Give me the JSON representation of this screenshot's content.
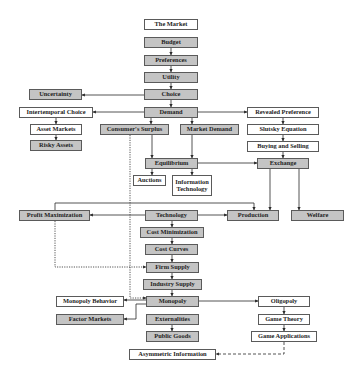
{
  "colors": {
    "shaded_box": "#c4c4c4",
    "plain_box": "#ffffff",
    "border": "#5a5a5a",
    "line": "#2a2a2a",
    "text": "#1e1e1e"
  },
  "legend_note": "Shaded boxes and white boxes distinguish chapter groups",
  "nodes": [
    {
      "id": "the_market",
      "label": "The Market",
      "shade": "white",
      "x": 144,
      "y": 19,
      "w": 54,
      "h": 11
    },
    {
      "id": "budget",
      "label": "Budget",
      "shade": "gray",
      "x": 144,
      "y": 37,
      "w": 54,
      "h": 11
    },
    {
      "id": "preferences",
      "label": "Preferences",
      "shade": "gray",
      "x": 144,
      "y": 55,
      "w": 54,
      "h": 11
    },
    {
      "id": "utility",
      "label": "Utility",
      "shade": "gray",
      "x": 144,
      "y": 72,
      "w": 54,
      "h": 11
    },
    {
      "id": "choice",
      "label": "Choice",
      "shade": "gray",
      "x": 144,
      "y": 89,
      "w": 54,
      "h": 11
    },
    {
      "id": "uncertainty",
      "label": "Uncertainty",
      "shade": "gray",
      "x": 29,
      "y": 89,
      "w": 53,
      "h": 11
    },
    {
      "id": "demand",
      "label": "Demand",
      "shade": "gray",
      "x": 144,
      "y": 107,
      "w": 54,
      "h": 11
    },
    {
      "id": "intertemporal_choice",
      "label": "Intertemporal Choice",
      "shade": "white",
      "x": 19,
      "y": 107,
      "w": 74,
      "h": 11
    },
    {
      "id": "revealed_preference",
      "label": "Revealed Preference",
      "shade": "white",
      "x": 247,
      "y": 107,
      "w": 72,
      "h": 11
    },
    {
      "id": "asset_markets",
      "label": "Asset Markets",
      "shade": "white",
      "x": 30,
      "y": 124,
      "w": 52,
      "h": 11
    },
    {
      "id": "risky_assets",
      "label": "Risky Assets",
      "shade": "gray",
      "x": 30,
      "y": 140,
      "w": 52,
      "h": 11
    },
    {
      "id": "consumers_surplus",
      "label": "Consumer's Surplus",
      "shade": "gray",
      "x": 100,
      "y": 124,
      "w": 69,
      "h": 11
    },
    {
      "id": "market_demand",
      "label": "Market Demand",
      "shade": "gray",
      "x": 180,
      "y": 124,
      "w": 59,
      "h": 11
    },
    {
      "id": "slutsky_equation",
      "label": "Slutsky Equation",
      "shade": "white",
      "x": 247,
      "y": 124,
      "w": 72,
      "h": 11
    },
    {
      "id": "buying_and_selling",
      "label": "Buying and Selling",
      "shade": "white",
      "x": 247,
      "y": 141,
      "w": 72,
      "h": 11
    },
    {
      "id": "equilibrium",
      "label": "Equilibrium",
      "shade": "gray",
      "x": 145,
      "y": 158,
      "w": 53,
      "h": 11
    },
    {
      "id": "exchange",
      "label": "Exchange",
      "shade": "gray",
      "x": 257,
      "y": 158,
      "w": 52,
      "h": 11
    },
    {
      "id": "auctions",
      "label": "Auctions",
      "shade": "white",
      "x": 133,
      "y": 175,
      "w": 33,
      "h": 11
    },
    {
      "id": "information_technology",
      "label": "Information Technology",
      "shade": "white",
      "x": 172,
      "y": 175,
      "w": 40,
      "h": 21,
      "multi": true
    },
    {
      "id": "profit_maximization",
      "label": "Profit Maximization",
      "shade": "gray",
      "x": 19,
      "y": 210,
      "w": 71,
      "h": 11
    },
    {
      "id": "technology",
      "label": "Technology",
      "shade": "gray",
      "x": 145,
      "y": 210,
      "w": 53,
      "h": 11
    },
    {
      "id": "production",
      "label": "Production",
      "shade": "gray",
      "x": 227,
      "y": 210,
      "w": 52,
      "h": 11
    },
    {
      "id": "welfare",
      "label": "Welfare",
      "shade": "gray",
      "x": 291,
      "y": 210,
      "w": 53,
      "h": 11
    },
    {
      "id": "cost_minimization",
      "label": "Cost Minimization",
      "shade": "gray",
      "x": 140,
      "y": 227,
      "w": 64,
      "h": 11
    },
    {
      "id": "cost_curves",
      "label": "Cost Curves",
      "shade": "gray",
      "x": 145,
      "y": 244,
      "w": 53,
      "h": 11
    },
    {
      "id": "firm_supply",
      "label": "Firm Supply",
      "shade": "gray",
      "x": 146,
      "y": 262,
      "w": 53,
      "h": 11
    },
    {
      "id": "industry_supply",
      "label": "Industry Supply",
      "shade": "gray",
      "x": 143,
      "y": 279,
      "w": 59,
      "h": 11
    },
    {
      "id": "monopoly",
      "label": "Monopoly",
      "shade": "gray",
      "x": 146,
      "y": 296,
      "w": 53,
      "h": 11
    },
    {
      "id": "monopoly_behavior",
      "label": "Monopoly Behavior",
      "shade": "white",
      "x": 56,
      "y": 296,
      "w": 68,
      "h": 11
    },
    {
      "id": "factor_markets",
      "label": "Factor Markets",
      "shade": "gray",
      "x": 56,
      "y": 314,
      "w": 68,
      "h": 11
    },
    {
      "id": "externalities",
      "label": "Externalities",
      "shade": "gray",
      "x": 146,
      "y": 314,
      "w": 53,
      "h": 11
    },
    {
      "id": "public_goods",
      "label": "Public Goods",
      "shade": "gray",
      "x": 146,
      "y": 331,
      "w": 53,
      "h": 11
    },
    {
      "id": "oligopoly",
      "label": "Oligopoly",
      "shade": "white",
      "x": 258,
      "y": 296,
      "w": 52,
      "h": 11
    },
    {
      "id": "game_theory",
      "label": "Game Theory",
      "shade": "white",
      "x": 258,
      "y": 314,
      "w": 52,
      "h": 11
    },
    {
      "id": "game_applications",
      "label": "Game Applications",
      "shade": "white",
      "x": 251,
      "y": 331,
      "w": 66,
      "h": 11
    },
    {
      "id": "asymmetric_information",
      "label": "Asymmetric Information",
      "shade": "white",
      "x": 129,
      "y": 349,
      "w": 87,
      "h": 11
    }
  ],
  "edges": [
    {
      "from": "budget",
      "to": "preferences",
      "style": "solid"
    },
    {
      "from": "preferences",
      "to": "utility",
      "style": "solid"
    },
    {
      "from": "utility",
      "to": "choice",
      "style": "solid"
    },
    {
      "from": "choice",
      "to": "uncertainty",
      "style": "solid"
    },
    {
      "from": "choice",
      "to": "demand",
      "style": "solid"
    },
    {
      "from": "demand",
      "to": "intertemporal_choice",
      "style": "solid"
    },
    {
      "from": "demand",
      "to": "revealed_preference",
      "style": "solid"
    },
    {
      "from": "demand",
      "to": "consumers_surplus",
      "style": "solid"
    },
    {
      "from": "demand",
      "to": "market_demand",
      "style": "solid"
    },
    {
      "from": "intertemporal_choice",
      "to": "asset_markets",
      "style": "solid"
    },
    {
      "from": "asset_markets",
      "to": "risky_assets",
      "style": "solid"
    },
    {
      "from": "revealed_preference",
      "to": "slutsky_equation",
      "style": "solid"
    },
    {
      "from": "slutsky_equation",
      "to": "buying_and_selling",
      "style": "solid"
    },
    {
      "from": "buying_and_selling",
      "to": "exchange",
      "style": "solid"
    },
    {
      "from": "consumers_surplus",
      "to": "equilibrium",
      "style": "solid"
    },
    {
      "from": "market_demand",
      "to": "equilibrium",
      "style": "solid"
    },
    {
      "from": "equilibrium",
      "to": "exchange",
      "style": "solid"
    },
    {
      "from": "equilibrium",
      "to": "auctions",
      "style": "solid"
    },
    {
      "from": "equilibrium",
      "to": "information_technology",
      "style": "solid"
    },
    {
      "from": "exchange",
      "to": "production",
      "style": "solid"
    },
    {
      "from": "exchange",
      "to": "welfare",
      "style": "solid"
    },
    {
      "from": "technology",
      "to": "profit_maximization",
      "style": "solid"
    },
    {
      "from": "technology",
      "to": "production",
      "style": "solid"
    },
    {
      "from": "profit_maximization",
      "to": "production",
      "style": "solid"
    },
    {
      "from": "technology",
      "to": "cost_minimization",
      "style": "solid"
    },
    {
      "from": "cost_minimization",
      "to": "cost_curves",
      "style": "solid"
    },
    {
      "from": "cost_curves",
      "to": "firm_supply",
      "style": "solid"
    },
    {
      "from": "firm_supply",
      "to": "industry_supply",
      "style": "solid"
    },
    {
      "from": "industry_supply",
      "to": "monopoly",
      "style": "solid"
    },
    {
      "from": "profit_maximization",
      "to": "firm_supply",
      "style": "dotted"
    },
    {
      "from": "consumers_surplus",
      "to": "monopoly",
      "style": "dotted"
    },
    {
      "from": "monopoly",
      "to": "monopoly_behavior",
      "style": "solid"
    },
    {
      "from": "monopoly",
      "to": "factor_markets",
      "style": "solid"
    },
    {
      "from": "monopoly",
      "to": "oligopoly",
      "style": "solid"
    },
    {
      "from": "externalities",
      "to": "public_goods",
      "style": "solid"
    },
    {
      "from": "oligopoly",
      "to": "game_theory",
      "style": "solid"
    },
    {
      "from": "game_theory",
      "to": "game_applications",
      "style": "solid"
    },
    {
      "from": "game_applications",
      "to": "asymmetric_information",
      "style": "dashed"
    }
  ]
}
